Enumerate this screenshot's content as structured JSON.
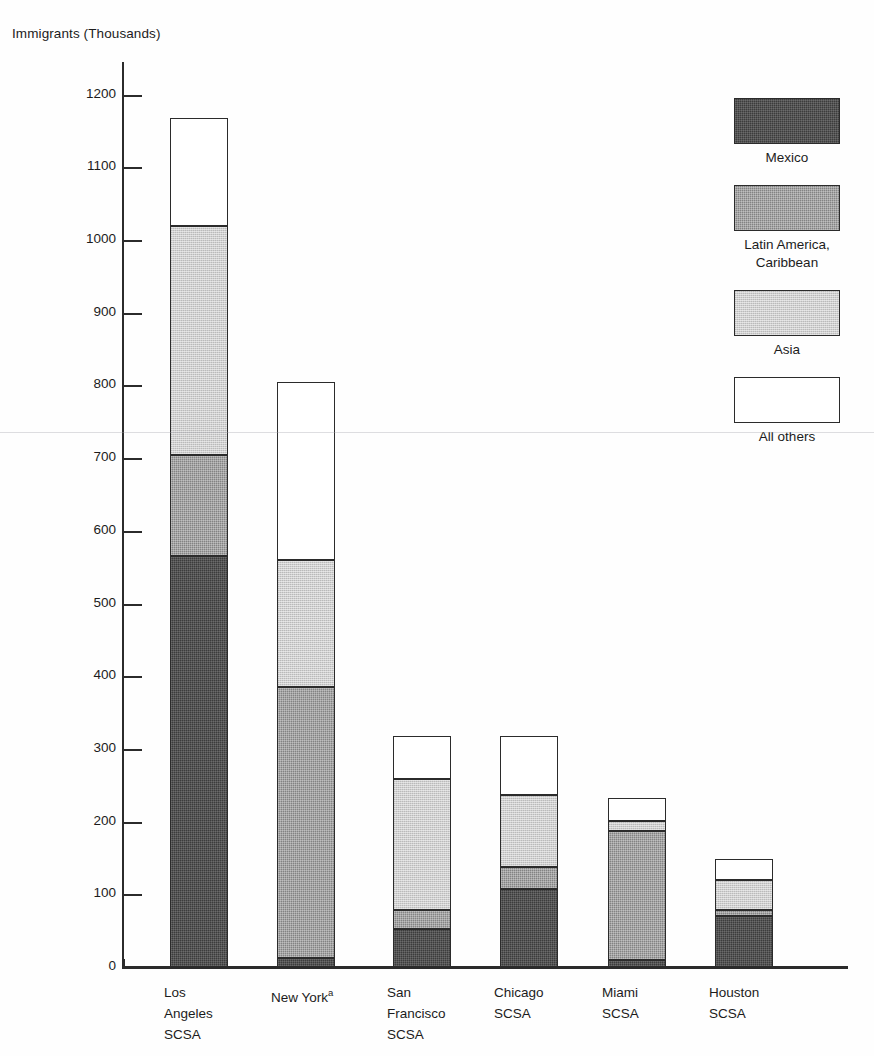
{
  "chart_data": {
    "type": "bar",
    "subtype": "stacked-vertical",
    "title": "",
    "ylabel": "Immigrants (Thousands)",
    "xlabel": "",
    "ylim": [
      0,
      1250
    ],
    "yticks": [
      0,
      100,
      200,
      300,
      400,
      500,
      600,
      700,
      800,
      900,
      1000,
      1100,
      1200
    ],
    "ytick_labels": [
      "0",
      "100",
      "200",
      "300",
      "400",
      "500",
      "600",
      "700",
      "800",
      "900",
      "1000",
      "1100",
      "1200"
    ],
    "grid": false,
    "legend_position": "top-right",
    "categories": [
      "Los Angeles SCSA",
      "New York",
      "San Francisco SCSA",
      "Chicago SCSA",
      "Miami SCSA",
      "Houston SCSA"
    ],
    "category_lines": [
      [
        "Los",
        "Angeles",
        "SCSA"
      ],
      [
        "New York"
      ],
      [
        "San",
        "Francisco",
        "SCSA"
      ],
      [
        "Chicago",
        "SCSA"
      ],
      [
        "Miami",
        "SCSA"
      ],
      [
        "Houston",
        "SCSA"
      ]
    ],
    "series": [
      {
        "name": "Mexico",
        "key": "mexico",
        "color": "#3c3c3c",
        "values": [
          565,
          12,
          52,
          108,
          10,
          70
        ]
      },
      {
        "name": "Latin America, Caribbean",
        "key": "latin",
        "color": "#838383",
        "values": [
          140,
          373,
          26,
          29,
          177,
          8
        ]
      },
      {
        "name": "Asia",
        "key": "asia",
        "color": "#cfcfcf",
        "values": [
          315,
          175,
          180,
          100,
          14,
          42
        ]
      },
      {
        "name": "All others",
        "key": "other",
        "color": "#ffffff",
        "values": [
          148,
          245,
          60,
          81,
          32,
          28
        ]
      }
    ],
    "totals": [
      1168,
      805,
      318,
      318,
      233,
      148
    ],
    "annotations": [
      {
        "text": "a",
        "attached_to": "New York",
        "type": "footnote-superscript"
      }
    ]
  },
  "axis": {
    "y_title": "Immigrants (Thousands)"
  },
  "legend": {
    "entries": [
      {
        "label": "Mexico",
        "swatch": "mexico"
      },
      {
        "label": "Latin America,\nCaribbean",
        "swatch": "latin"
      },
      {
        "label": "Asia",
        "swatch": "asia"
      },
      {
        "label": "All others",
        "swatch": "other"
      }
    ]
  },
  "footnote_marker": "a"
}
